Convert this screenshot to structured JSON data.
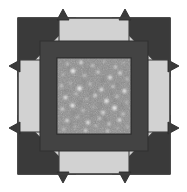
{
  "figure": {
    "title": "Square aperture with speckle field and corner arrow markers",
    "width": 187,
    "height": 192,
    "background_color": "#ffffff"
  },
  "colors": {
    "background": "#ffffff",
    "plate_light": "#d2d2d2",
    "plate_light_edge": "#c8c8c8",
    "frame_dark": "#434343",
    "wedge_dark": "#3a3a3a",
    "outline": "#404040",
    "speckle_field_base": "#8e8e8e",
    "speckle_bright": "#fdfdfd",
    "speckle_dim": "#6e6e6e"
  },
  "layout": {
    "plate": {
      "x": 18,
      "y": 18,
      "width": 152,
      "height": 156,
      "label": "outer-light-plate"
    },
    "frame": {
      "x": 40,
      "y": 41,
      "width": 108,
      "height": 110,
      "thickness": 17,
      "label": "dark-inner-frame"
    },
    "speckle_window": {
      "x": 57,
      "y": 58,
      "width": 74,
      "height": 76,
      "label": "speckle-detector-window"
    },
    "outline_width": 1.2
  },
  "corner_wedges": {
    "count": 4,
    "names": [
      "top-left-wedge",
      "top-right-wedge",
      "bottom-right-wedge",
      "bottom-left-wedge"
    ],
    "description": "Dark right-triangle wedges seated in each corner of the light plate, hypotenuse facing the plate centre."
  },
  "arrow_tips": {
    "count": 8,
    "names": [
      "arrow-tip-top-left",
      "arrow-tip-top-right",
      "arrow-tip-right-top",
      "arrow-tip-right-bottom",
      "arrow-tip-bottom-right",
      "arrow-tip-bottom-left",
      "arrow-tip-left-bottom",
      "arrow-tip-left-top"
    ],
    "description": "Small dark barbed arrowheads protruding beyond the plate edge in pairs along each side."
  },
  "chart_data": {
    "type": "scatter",
    "xlabel": "",
    "ylabel": "",
    "xlim": [
      0,
      74
    ],
    "ylim": [
      0,
      76
    ],
    "grid": false,
    "legend": false,
    "note": "Bright spot positions (cx, cy) and radii in window-local pixel units; intensity 0-1 where 1 is white.",
    "fields": [
      "cx",
      "cy",
      "r",
      "intensity"
    ],
    "points": [
      [
        10.5,
        6.0,
        2.0,
        0.7
      ],
      [
        24.0,
        4.5,
        2.6,
        0.85
      ],
      [
        35.5,
        7.5,
        2.1,
        0.72
      ],
      [
        47.0,
        3.5,
        1.7,
        0.62
      ],
      [
        58.5,
        9.0,
        2.3,
        0.78
      ],
      [
        66.5,
        5.0,
        1.5,
        0.58
      ],
      [
        6.0,
        16.5,
        1.8,
        0.66
      ],
      [
        16.0,
        13.0,
        3.4,
        0.97
      ],
      [
        27.5,
        17.5,
        2.0,
        0.74
      ],
      [
        41.0,
        14.0,
        2.4,
        0.8
      ],
      [
        53.0,
        19.5,
        3.0,
        0.92
      ],
      [
        63.0,
        15.0,
        2.6,
        0.86
      ],
      [
        70.0,
        21.0,
        1.9,
        0.68
      ],
      [
        4.5,
        28.0,
        2.2,
        0.75
      ],
      [
        13.0,
        25.0,
        1.6,
        0.6
      ],
      [
        22.5,
        30.5,
        3.6,
        0.98
      ],
      [
        33.0,
        26.0,
        2.0,
        0.71
      ],
      [
        44.5,
        31.5,
        2.8,
        0.9
      ],
      [
        56.0,
        28.5,
        2.2,
        0.77
      ],
      [
        67.5,
        33.0,
        3.1,
        0.93
      ],
      [
        8.5,
        39.5,
        2.9,
        0.91
      ],
      [
        19.0,
        36.0,
        2.0,
        0.7
      ],
      [
        29.5,
        41.0,
        1.7,
        0.63
      ],
      [
        38.0,
        37.5,
        2.5,
        0.83
      ],
      [
        49.5,
        43.0,
        3.3,
        0.96
      ],
      [
        60.0,
        38.5,
        2.1,
        0.73
      ],
      [
        69.5,
        44.5,
        1.8,
        0.65
      ],
      [
        5.5,
        51.0,
        2.4,
        0.81
      ],
      [
        15.5,
        47.5,
        3.2,
        0.95
      ],
      [
        26.0,
        52.5,
        2.0,
        0.72
      ],
      [
        36.5,
        49.0,
        1.6,
        0.59
      ],
      [
        46.0,
        54.5,
        2.7,
        0.88
      ],
      [
        57.5,
        50.0,
        3.5,
        0.99
      ],
      [
        66.0,
        56.0,
        2.2,
        0.76
      ],
      [
        10.0,
        62.5,
        2.6,
        0.86
      ],
      [
        20.5,
        59.0,
        1.9,
        0.67
      ],
      [
        31.0,
        64.5,
        3.0,
        0.92
      ],
      [
        42.5,
        60.5,
        2.1,
        0.74
      ],
      [
        52.0,
        66.0,
        2.3,
        0.79
      ],
      [
        62.5,
        62.0,
        2.8,
        0.89
      ],
      [
        70.5,
        68.5,
        1.7,
        0.61
      ],
      [
        7.0,
        71.5,
        2.0,
        0.7
      ],
      [
        18.0,
        69.0,
        1.5,
        0.56
      ],
      [
        28.5,
        72.5,
        2.4,
        0.82
      ],
      [
        39.0,
        68.0,
        1.8,
        0.64
      ],
      [
        50.5,
        73.0,
        2.2,
        0.76
      ],
      [
        60.5,
        70.5,
        1.6,
        0.58
      ]
    ],
    "dim_points": [
      [
        12.0,
        9.5,
        1.5,
        0.22
      ],
      [
        30.0,
        12.0,
        1.3,
        0.2
      ],
      [
        45.5,
        22.0,
        1.6,
        0.24
      ],
      [
        9.0,
        33.0,
        1.4,
        0.21
      ],
      [
        34.5,
        34.5,
        1.5,
        0.23
      ],
      [
        61.0,
        27.0,
        1.3,
        0.19
      ],
      [
        23.0,
        44.5,
        1.6,
        0.25
      ],
      [
        54.0,
        35.0,
        1.4,
        0.21
      ],
      [
        17.0,
        55.0,
        1.5,
        0.22
      ],
      [
        43.0,
        47.5,
        1.3,
        0.2
      ],
      [
        65.0,
        48.0,
        1.5,
        0.23
      ],
      [
        35.0,
        57.5,
        1.4,
        0.21
      ],
      [
        48.0,
        62.0,
        1.6,
        0.24
      ],
      [
        14.0,
        66.5,
        1.3,
        0.19
      ],
      [
        58.0,
        43.0,
        1.4,
        0.22
      ],
      [
        26.5,
        23.5,
        1.5,
        0.23
      ]
    ]
  }
}
